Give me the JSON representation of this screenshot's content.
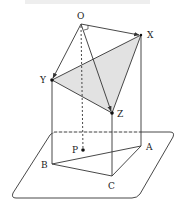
{
  "figure": {
    "type": "3d-geometry-diagram",
    "points": {
      "O": {
        "label": "O",
        "x": 81,
        "y": 24,
        "lx": 77,
        "ly": 19
      },
      "X": {
        "label": "X",
        "x": 141,
        "y": 35,
        "lx": 147,
        "ly": 38
      },
      "Y": {
        "label": "Y",
        "x": 52,
        "y": 80,
        "lx": 40,
        "ly": 83
      },
      "Z": {
        "label": "Z",
        "x": 112,
        "y": 113,
        "lx": 117,
        "ly": 117
      },
      "P": {
        "label": "P",
        "x": 83,
        "y": 150,
        "lx": 72,
        "ly": 153
      },
      "A": {
        "label": "A",
        "x": 141,
        "y": 146,
        "lx": 146,
        "ly": 150
      },
      "B": {
        "label": "B",
        "x": 52,
        "y": 164,
        "lx": 41,
        "ly": 168
      },
      "C": {
        "label": "C",
        "x": 112,
        "y": 176,
        "lx": 108,
        "ly": 189
      }
    },
    "shaded_triangle": [
      "X",
      "Y",
      "Z"
    ],
    "shade_color": "#e2e2e2",
    "line_color": "#333333",
    "vectors": [
      [
        "O",
        "X"
      ],
      [
        "O",
        "Y"
      ],
      [
        "O",
        "Z"
      ]
    ],
    "hidden_segment": [
      "O",
      "P"
    ],
    "edges": [
      [
        "Y",
        "Z"
      ],
      [
        "X",
        "Z"
      ],
      [
        "X",
        "Y"
      ],
      [
        "Y",
        "B"
      ],
      [
        "Z",
        "C"
      ],
      [
        "X",
        "A"
      ],
      [
        "B",
        "C"
      ],
      [
        "C",
        "A"
      ],
      [
        "B",
        "A"
      ]
    ],
    "plane": {
      "label": "plane"
    }
  }
}
